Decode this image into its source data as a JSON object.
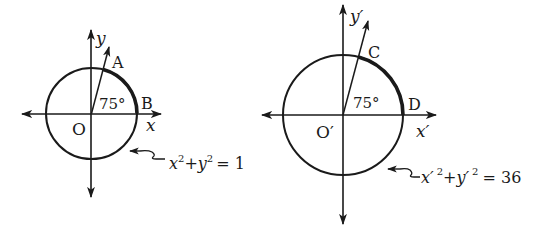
{
  "colors": {
    "background": "#ffffff",
    "stroke": "#1a1a1a"
  },
  "diagrams": [
    {
      "name": "unit-circle",
      "origin_label": "O",
      "x_axis_label": "x",
      "y_axis_label": "y",
      "point_on_ray": "A",
      "point_on_axis": "B",
      "angle_label": "75°",
      "equation": {
        "x_term": "x",
        "x_exp": "2",
        "plus": "+",
        "y_term": "y",
        "y_exp": "2",
        "rhs": "= 1"
      }
    },
    {
      "name": "radius-6-circle",
      "origin_label": "O′",
      "x_axis_label": "x′",
      "y_axis_label": "y′",
      "point_on_ray": "C",
      "point_on_axis": "D",
      "angle_label": "75°",
      "equation": {
        "x_term": "x′",
        "x_exp": "2",
        "plus": "+",
        "y_term": "y′",
        "y_exp": "2",
        "rhs": "= 36"
      }
    }
  ]
}
